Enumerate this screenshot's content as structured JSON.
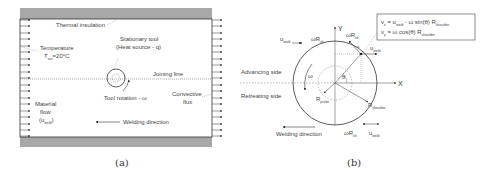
{
  "panel_a": {
    "caption": "(a)",
    "labels": {
      "thermal_insulation": "Thermal insulation",
      "stationary_tool_1": "Stationary tool",
      "stationary_tool_2": "(Heat source - q)",
      "temperature": "Temperature",
      "t_out": "T",
      "t_out_sub": "out",
      "t_out_val": "=20°C",
      "joining_line": "Joining line",
      "tool_rotation": "Tool rotation - ω",
      "convective_1": "Convective",
      "convective_2": "flux",
      "material_1": "Material",
      "material_2": "flow",
      "material_3_open": "(u",
      "material_3_sub": "weld",
      "material_3_close": ")",
      "welding_direction": "Welding direction"
    },
    "colors": {
      "insulation": "#a8a8a8",
      "border": "#333333"
    }
  },
  "panel_b": {
    "caption": "(b)",
    "labels": {
      "eq1_lhs": "v",
      "eq1_lhs_sub": "x",
      "eq1_rhs": " = u",
      "eq1_rhs_sub": "weld",
      "eq1_rest": " - ω sin(θ) R",
      "eq1_rest_sub": "shoulder",
      "eq2_lhs": "v",
      "eq2_lhs_sub": "y",
      "eq2_rest": " = ω cos(θ) R",
      "eq2_rest_sub": "shoulder",
      "axis_x": "X",
      "axis_y": "Y",
      "advancing_side": "Advancing side",
      "retreating_side": "Retreating side",
      "welding_direction": "Welding direction",
      "u_weld": "u",
      "u_weld_sub": "weld",
      "omega_r": "ωR",
      "omega_r_sub": "sh",
      "omega": "ω",
      "theta": "θ",
      "r_probe": "R",
      "r_probe_sub": "probe",
      "r_shoulder": "R",
      "r_shoulder_sub": "shoulder"
    }
  }
}
